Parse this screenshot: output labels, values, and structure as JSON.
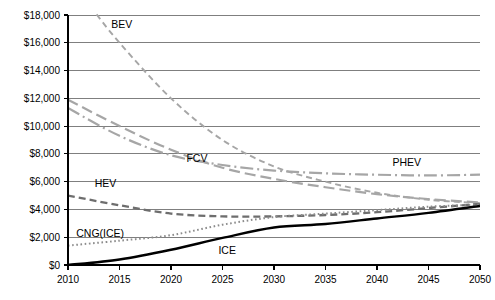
{
  "chart_data": {
    "type": "line",
    "title": "",
    "xlabel": "",
    "ylabel": "",
    "xlim": [
      2010,
      2050
    ],
    "ylim": [
      0,
      18000
    ],
    "grid": true,
    "legend_position": "inline-labels",
    "x_ticks": [
      2010,
      2015,
      2020,
      2025,
      2030,
      2035,
      2040,
      2045,
      2050
    ],
    "x_tick_labels": [
      "2010",
      "2015",
      "2020",
      "2025",
      "2030",
      "2035",
      "2040",
      "2045",
      "2050"
    ],
    "y_ticks": [
      0,
      2000,
      4000,
      6000,
      8000,
      10000,
      12000,
      14000,
      16000,
      18000
    ],
    "y_tick_labels": [
      "$0",
      "$2,000",
      "$4,000",
      "$6,000",
      "$8,000",
      "$10,000",
      "$12,000",
      "$14,000",
      "$16,000",
      "$18,000"
    ],
    "x": [
      2010,
      2015,
      2020,
      2025,
      2030,
      2035,
      2040,
      2045,
      2050
    ],
    "series": [
      {
        "name": "BEV",
        "label": "BEV",
        "color": "#a6a6a6",
        "width": 1.9,
        "dash": "6,4",
        "label_x": 2014.2,
        "label_y": 17100,
        "x": [
          2012.2,
          2015,
          2020,
          2025,
          2030,
          2035,
          2040,
          2045,
          2050
        ],
        "values": [
          18600,
          16000,
          12000,
          9000,
          7100,
          6000,
          5200,
          4700,
          4450
        ]
      },
      {
        "name": "PHEV",
        "label": "PHEV",
        "color": "#a6a6a6",
        "width": 2.2,
        "dash": "11,5",
        "label_x": 2041.5,
        "label_y": 7150,
        "x": [
          2010,
          2015,
          2020,
          2025,
          2030,
          2035,
          2040,
          2045,
          2050
        ],
        "values": [
          11900,
          10000,
          8300,
          7000,
          6200,
          5600,
          5100,
          4750,
          4500
        ]
      },
      {
        "name": "FCV",
        "label": "FCV",
        "color": "#a6a6a6",
        "width": 2.2,
        "dash": "13,4,2,4",
        "label_x": 2021.5,
        "label_y": 7450,
        "x": [
          2010,
          2015,
          2020,
          2025,
          2030,
          2035,
          2040,
          2045,
          2050
        ],
        "values": [
          11300,
          9300,
          7900,
          7200,
          6800,
          6600,
          6500,
          6450,
          6500
        ]
      },
      {
        "name": "HEV",
        "label": "HEV",
        "color": "#6e6e6e",
        "width": 2.3,
        "dash": "7,4",
        "label_x": 2012.6,
        "label_y": 5650,
        "x": [
          2010,
          2015,
          2020,
          2025,
          2030,
          2035,
          2040,
          2045,
          2050
        ],
        "values": [
          5000,
          4300,
          3700,
          3500,
          3500,
          3600,
          3800,
          4100,
          4400
        ]
      },
      {
        "name": "CNG(ICE)",
        "label": "CNG(ICE)",
        "color": "#8c8c8c",
        "width": 2.0,
        "dash": "1.6,2.6",
        "label_x": 2010.8,
        "label_y": 2050,
        "x": [
          2010,
          2015,
          2020,
          2025,
          2030,
          2035,
          2040,
          2045,
          2050
        ],
        "values": [
          1400,
          1750,
          2150,
          2900,
          3450,
          3700,
          3950,
          4200,
          4350
        ]
      },
      {
        "name": "ICE",
        "label": "ICE",
        "color": "#000000",
        "width": 2.4,
        "dash": "none",
        "label_x": 2024.6,
        "label_y": 800,
        "x": [
          2010,
          2015,
          2020,
          2025,
          2030,
          2035,
          2040,
          2045,
          2050
        ],
        "values": [
          0,
          400,
          1100,
          1950,
          2700,
          2950,
          3350,
          3750,
          4250
        ]
      }
    ]
  }
}
